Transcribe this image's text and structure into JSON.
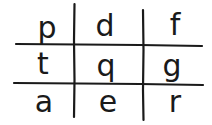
{
  "grid": {
    "rows": 3,
    "cols": 3,
    "line_color": "#1a1a1a",
    "text_color": "#1a1a1a",
    "cells": [
      [
        "p",
        "d",
        "f"
      ],
      [
        "t",
        "q",
        "g"
      ],
      [
        "a",
        "e",
        "r"
      ]
    ]
  }
}
